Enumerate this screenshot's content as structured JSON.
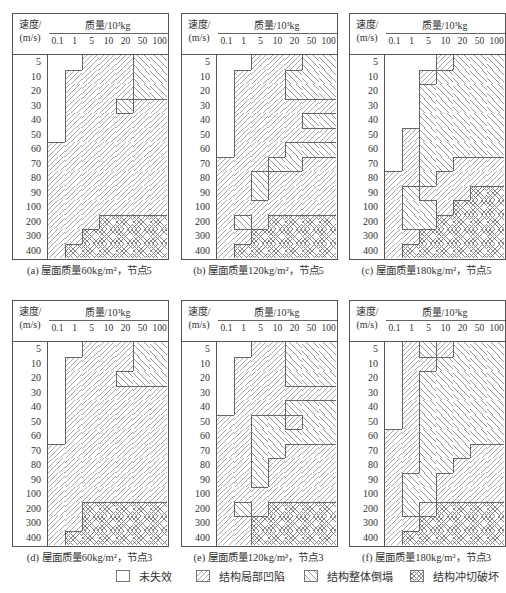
{
  "axis": {
    "velocity_label_line1": "速度/",
    "velocity_label_line2": "(m/s)",
    "mass_label": "质量/10³kg",
    "mass_ticks": [
      "0.1",
      "1",
      "5",
      "10",
      "20",
      "50",
      "100"
    ],
    "velocity_ticks": [
      "5",
      "10",
      "20",
      "30",
      "40",
      "50",
      "60",
      "70",
      "80",
      "90",
      "100",
      "200",
      "300",
      "400"
    ]
  },
  "legend": [
    {
      "label": "未失效",
      "state": 0
    },
    {
      "label": "结构局部凹陷",
      "state": 1
    },
    {
      "label": "结构整体倒塌",
      "state": 2
    },
    {
      "label": "结构冲切破坏",
      "state": 3
    }
  ],
  "panels": [
    {
      "id": "a",
      "caption": "(a) 屋面质量60kg/m²，节点5",
      "grid": [
        [
          0,
          0,
          1,
          1,
          1,
          2,
          2
        ],
        [
          0,
          1,
          1,
          1,
          1,
          2,
          2
        ],
        [
          0,
          1,
          1,
          1,
          1,
          2,
          2
        ],
        [
          0,
          1,
          1,
          1,
          2,
          1,
          1
        ],
        [
          0,
          1,
          1,
          1,
          1,
          1,
          1
        ],
        [
          0,
          1,
          1,
          1,
          1,
          1,
          1
        ],
        [
          1,
          1,
          1,
          1,
          1,
          1,
          1
        ],
        [
          1,
          1,
          1,
          1,
          1,
          1,
          1
        ],
        [
          1,
          1,
          1,
          1,
          1,
          1,
          1
        ],
        [
          1,
          1,
          1,
          1,
          1,
          1,
          1
        ],
        [
          1,
          1,
          1,
          1,
          1,
          1,
          1
        ],
        [
          1,
          1,
          1,
          3,
          3,
          3,
          3
        ],
        [
          1,
          1,
          3,
          3,
          3,
          3,
          3
        ],
        [
          1,
          3,
          3,
          3,
          3,
          3,
          3
        ]
      ]
    },
    {
      "id": "b",
      "caption": "(b) 屋面质量120kg/m²，节点5",
      "grid": [
        [
          0,
          0,
          1,
          1,
          1,
          2,
          2
        ],
        [
          0,
          1,
          1,
          1,
          2,
          2,
          2
        ],
        [
          0,
          1,
          1,
          1,
          2,
          2,
          2
        ],
        [
          0,
          1,
          1,
          1,
          1,
          1,
          1
        ],
        [
          0,
          1,
          1,
          1,
          1,
          2,
          2
        ],
        [
          0,
          1,
          1,
          1,
          1,
          1,
          1
        ],
        [
          0,
          1,
          1,
          1,
          2,
          2,
          2
        ],
        [
          1,
          1,
          1,
          2,
          2,
          1,
          1
        ],
        [
          1,
          1,
          2,
          1,
          1,
          1,
          1
        ],
        [
          1,
          1,
          2,
          1,
          1,
          1,
          1
        ],
        [
          1,
          1,
          1,
          1,
          1,
          1,
          1
        ],
        [
          1,
          2,
          1,
          3,
          3,
          3,
          3
        ],
        [
          1,
          1,
          3,
          3,
          3,
          3,
          3
        ],
        [
          1,
          3,
          3,
          3,
          3,
          3,
          3
        ]
      ]
    },
    {
      "id": "c",
      "caption": "(c) 屋面质量180kg/m²，节点5",
      "grid": [
        [
          0,
          0,
          0,
          1,
          2,
          2,
          2
        ],
        [
          0,
          0,
          1,
          2,
          2,
          2,
          2
        ],
        [
          0,
          0,
          2,
          2,
          2,
          2,
          2
        ],
        [
          0,
          0,
          2,
          2,
          2,
          2,
          2
        ],
        [
          0,
          0,
          2,
          2,
          2,
          2,
          2
        ],
        [
          0,
          1,
          2,
          2,
          2,
          2,
          2
        ],
        [
          0,
          1,
          2,
          2,
          2,
          2,
          2
        ],
        [
          0,
          1,
          2,
          2,
          1,
          1,
          1
        ],
        [
          1,
          1,
          2,
          1,
          1,
          1,
          1
        ],
        [
          1,
          2,
          1,
          1,
          1,
          3,
          3
        ],
        [
          1,
          2,
          2,
          1,
          3,
          3,
          3
        ],
        [
          1,
          2,
          2,
          3,
          3,
          3,
          3
        ],
        [
          1,
          1,
          3,
          3,
          3,
          3,
          3
        ],
        [
          1,
          3,
          3,
          3,
          3,
          3,
          3
        ]
      ]
    },
    {
      "id": "d",
      "caption": "(d) 屋面质量60kg/m²，节点3",
      "grid": [
        [
          0,
          0,
          1,
          1,
          1,
          2,
          2
        ],
        [
          0,
          1,
          1,
          1,
          1,
          2,
          2
        ],
        [
          0,
          1,
          1,
          1,
          2,
          2,
          2
        ],
        [
          0,
          1,
          1,
          1,
          1,
          1,
          1
        ],
        [
          0,
          1,
          1,
          1,
          1,
          1,
          1
        ],
        [
          0,
          1,
          1,
          1,
          1,
          1,
          1
        ],
        [
          0,
          1,
          1,
          1,
          1,
          1,
          1
        ],
        [
          1,
          1,
          1,
          1,
          1,
          1,
          1
        ],
        [
          1,
          1,
          1,
          1,
          1,
          1,
          1
        ],
        [
          1,
          1,
          1,
          1,
          1,
          1,
          1
        ],
        [
          1,
          1,
          1,
          1,
          1,
          1,
          1
        ],
        [
          1,
          1,
          3,
          3,
          3,
          3,
          3
        ],
        [
          1,
          1,
          3,
          3,
          3,
          3,
          3
        ],
        [
          1,
          3,
          3,
          3,
          3,
          3,
          3
        ]
      ]
    },
    {
      "id": "e",
      "caption": "(e) 屋面质量120kg/m²，节点3",
      "grid": [
        [
          0,
          0,
          1,
          1,
          2,
          2,
          2
        ],
        [
          0,
          1,
          1,
          1,
          2,
          2,
          2
        ],
        [
          0,
          1,
          1,
          1,
          2,
          2,
          2
        ],
        [
          0,
          1,
          1,
          1,
          1,
          1,
          1
        ],
        [
          0,
          1,
          1,
          1,
          2,
          2,
          2
        ],
        [
          1,
          1,
          2,
          2,
          1,
          2,
          2
        ],
        [
          1,
          1,
          2,
          2,
          2,
          2,
          2
        ],
        [
          1,
          1,
          2,
          2,
          1,
          1,
          1
        ],
        [
          1,
          1,
          2,
          1,
          1,
          1,
          1
        ],
        [
          1,
          1,
          2,
          1,
          1,
          1,
          1
        ],
        [
          1,
          1,
          1,
          1,
          1,
          1,
          1
        ],
        [
          1,
          2,
          1,
          3,
          3,
          3,
          3
        ],
        [
          1,
          1,
          3,
          3,
          3,
          3,
          3
        ],
        [
          1,
          1,
          3,
          3,
          3,
          3,
          3
        ]
      ]
    },
    {
      "id": "f",
      "caption": "(f) 屋面质量180kg/m²，节点3",
      "grid": [
        [
          0,
          1,
          2,
          1,
          2,
          2,
          2
        ],
        [
          0,
          1,
          1,
          2,
          2,
          2,
          2
        ],
        [
          0,
          1,
          2,
          2,
          2,
          2,
          2
        ],
        [
          0,
          1,
          2,
          2,
          2,
          2,
          2
        ],
        [
          0,
          1,
          2,
          2,
          2,
          2,
          2
        ],
        [
          0,
          1,
          2,
          2,
          2,
          2,
          2
        ],
        [
          1,
          1,
          2,
          2,
          2,
          2,
          2
        ],
        [
          1,
          1,
          2,
          2,
          2,
          1,
          1
        ],
        [
          1,
          1,
          2,
          2,
          1,
          1,
          1
        ],
        [
          1,
          2,
          2,
          1,
          1,
          1,
          1
        ],
        [
          1,
          2,
          2,
          1,
          1,
          1,
          1
        ],
        [
          1,
          2,
          1,
          3,
          3,
          3,
          3
        ],
        [
          1,
          1,
          3,
          3,
          3,
          3,
          3
        ],
        [
          1,
          3,
          3,
          3,
          3,
          3,
          3
        ]
      ]
    }
  ]
}
